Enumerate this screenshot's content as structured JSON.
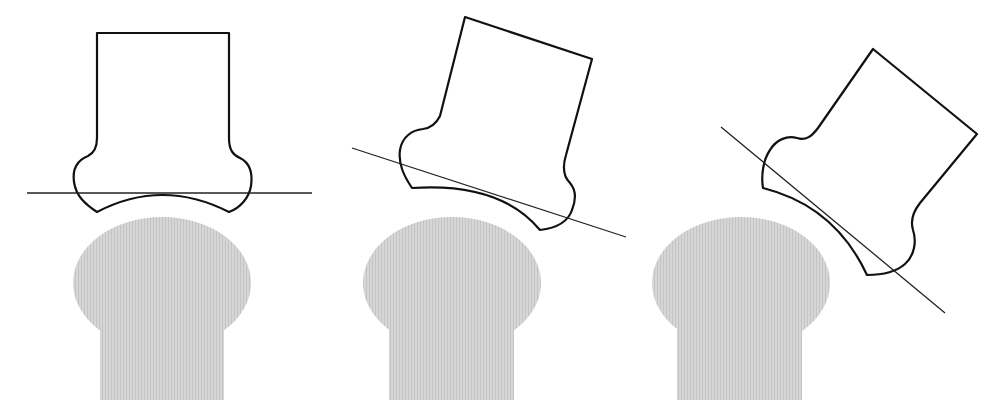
{
  "diagram": {
    "colors": {
      "background": "#ffffff",
      "outline": "#111111",
      "tangent_line": "#222222",
      "convex_bone_fill": "#d4d4d4",
      "convex_bone_hatch": "#c6c6c6"
    },
    "panels": [
      {
        "id": "neutral",
        "rotation_deg": 0,
        "convex_bone": {
          "head": {
            "cx": 162,
            "cy": 283,
            "rx": 89,
            "ry": 66
          },
          "shaft": {
            "x": 100,
            "y": 318,
            "w": 124,
            "h": 82
          }
        },
        "concave_bone_path": "M97,33 L229,33 L229,138 C229,150 233,155 240,158 C250,163 253,172 251,186 C249,198 240,208 229,212 Q162,178 97,212 C85,204 76,196 74,182 C72,168 78,160 88,156 C94,153 97,148 97,138 Z",
        "tangent_line": {
          "x1": 27,
          "y1": 193,
          "x2": 312,
          "y2": 193
        }
      },
      {
        "id": "tilted-moderate",
        "rotation_deg": 22,
        "convex_bone": {
          "head": {
            "cx": 452,
            "cy": 283,
            "rx": 89,
            "ry": 66
          },
          "shaft": {
            "x": 389,
            "y": 318,
            "w": 125,
            "h": 82
          }
        },
        "concave_bone_path": "M465,17 L592,59 L566,155 C562,168 564,177 570,183 C576,190 576,200 572,210 C568,222 557,228 540,230 Q500,182 412,188 C404,176 398,164 400,150 C402,137 412,130 423,129 C431,128 436,124 440,116 Z",
        "tangent_line": {
          "x1": 352,
          "y1": 148,
          "x2": 626,
          "y2": 237
        }
      },
      {
        "id": "tilted-large",
        "rotation_deg": 40,
        "convex_bone": {
          "head": {
            "cx": 741,
            "cy": 283,
            "rx": 89,
            "ry": 66
          },
          "shaft": {
            "x": 677,
            "y": 318,
            "w": 125,
            "h": 82
          }
        },
        "concave_bone_path": "M873,49 L977,134 L920,203 C913,212 910,220 913,230 C917,242 914,256 905,264 C896,272 882,275 867,275 Q835,206 763,188 C761,176 763,160 770,150 C776,140 787,135 797,138 C806,141 812,136 818,128 Z",
        "tangent_line": {
          "x1": 721,
          "y1": 127,
          "x2": 945,
          "y2": 313
        }
      }
    ]
  }
}
